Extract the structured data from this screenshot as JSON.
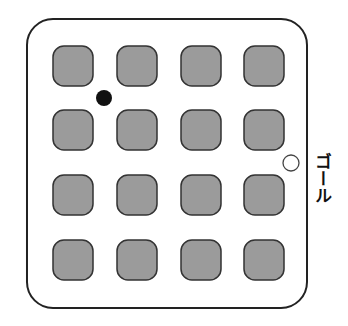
{
  "diagram": {
    "type": "grid-maze",
    "board": {
      "x": 27,
      "y": 19,
      "width": 280,
      "height": 289,
      "corner_radius": 26,
      "stroke": "#222222",
      "fill": "#ffffff"
    },
    "obstacles": {
      "rows": 4,
      "cols": 4,
      "size": 40,
      "radius": 11,
      "fill": "#9b9b9b",
      "stroke": "#333333",
      "col_x": [
        53,
        117,
        181,
        244
      ],
      "row_y": [
        46,
        110,
        175,
        240
      ]
    },
    "start_marker": {
      "cx": 104,
      "cy": 98,
      "r": 8,
      "fill": "#111111",
      "label": "start"
    },
    "goal_marker": {
      "cx": 291,
      "cy": 163,
      "r": 8,
      "fill": "#ffffff",
      "stroke": "#444444"
    },
    "goal_label": "ゴール"
  }
}
